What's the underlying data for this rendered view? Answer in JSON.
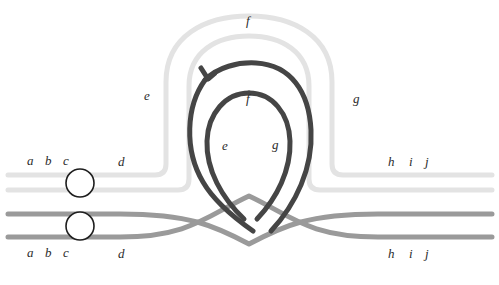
{
  "figure": {
    "kind": "knot-ribbon-diagram",
    "background": "#ffffff",
    "width": 499,
    "height": 285
  },
  "palette": {
    "light_strand": "#e3e3e3",
    "mid_strand": "#9a9a9a",
    "dark_strand": "#454545",
    "circle_stroke": "#1e1e1e",
    "circle_fill": "#ffffff",
    "label_color": "#2b2b2b"
  },
  "strands": [
    {
      "name": "upper-light-pair",
      "color": "#e3e3e3",
      "width": 5,
      "description": "two parallel very-light-gray curves entering at left, rising into a large arch over the top and exiting at right"
    },
    {
      "name": "lower-mid-pair",
      "color": "#9a9a9a",
      "width": 5,
      "description": "two parallel medium-gray curves running low across the figure and crossing the dark loop near the bottom center"
    },
    {
      "name": "inner-dark-loop",
      "color": "#454545",
      "width": 5,
      "description": "two parallel dark-gray curves forming a teardrop loop with a small notch at its upper left"
    }
  ],
  "nodes": [
    {
      "name": "circle-upper",
      "cx": 80,
      "cy": 183,
      "r": 14
    },
    {
      "name": "circle-lower",
      "cx": 80,
      "cy": 226,
      "r": 14
    }
  ],
  "labels": {
    "top_arch": {
      "text": "f",
      "x": 246,
      "y": 14
    },
    "outer_left": {
      "text": "e",
      "x": 144,
      "y": 89
    },
    "outer_right": {
      "text": "g",
      "x": 353,
      "y": 92
    },
    "inner_top": {
      "text": "f",
      "x": 246,
      "y": 92
    },
    "inner_left": {
      "text": "e",
      "x": 222,
      "y": 139
    },
    "inner_right": {
      "text": "g",
      "x": 272,
      "y": 138
    },
    "upper_left_row": [
      {
        "text": "a",
        "x": 27,
        "y": 154
      },
      {
        "text": "b",
        "x": 45,
        "y": 154
      },
      {
        "text": "c",
        "x": 63,
        "y": 154
      },
      {
        "text": "d",
        "x": 118,
        "y": 155
      }
    ],
    "upper_right_row": [
      {
        "text": "h",
        "x": 388,
        "y": 155
      },
      {
        "text": "i",
        "x": 409,
        "y": 155
      },
      {
        "text": "j",
        "x": 425,
        "y": 155
      }
    ],
    "lower_left_row": [
      {
        "text": "a",
        "x": 27,
        "y": 246
      },
      {
        "text": "b",
        "x": 45,
        "y": 246
      },
      {
        "text": "c",
        "x": 63,
        "y": 246
      },
      {
        "text": "d",
        "x": 118,
        "y": 247
      }
    ],
    "lower_right_row": [
      {
        "text": "h",
        "x": 388,
        "y": 247
      },
      {
        "text": "i",
        "x": 409,
        "y": 247
      },
      {
        "text": "j",
        "x": 425,
        "y": 247
      }
    ]
  }
}
